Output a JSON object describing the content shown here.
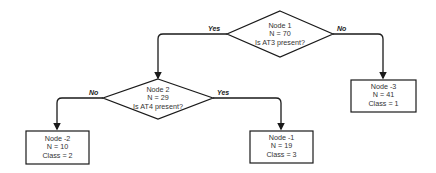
{
  "nodes": {
    "node1": {
      "title": "Node 1",
      "n": "N = 70",
      "question": "Is AT3 present?"
    },
    "node2": {
      "title": "Node 2",
      "n": "N = 29",
      "question": "Is AT4 present?"
    },
    "leaf_m2": {
      "title": "Node -2",
      "n": "N = 10",
      "class": "Class = 2"
    },
    "leaf_m1": {
      "title": "Node -1",
      "n": "N = 19",
      "class": "Class = 3"
    },
    "leaf_m3": {
      "title": "Node -3",
      "n": "N = 41",
      "class": "Class = 1"
    }
  },
  "edges": {
    "node1_yes": "Yes",
    "node1_no": "No",
    "node2_no": "No",
    "node2_yes": "Yes"
  },
  "colors": {
    "stroke": "#1a1a1a",
    "text": "#333333",
    "background": "#ffffff"
  }
}
